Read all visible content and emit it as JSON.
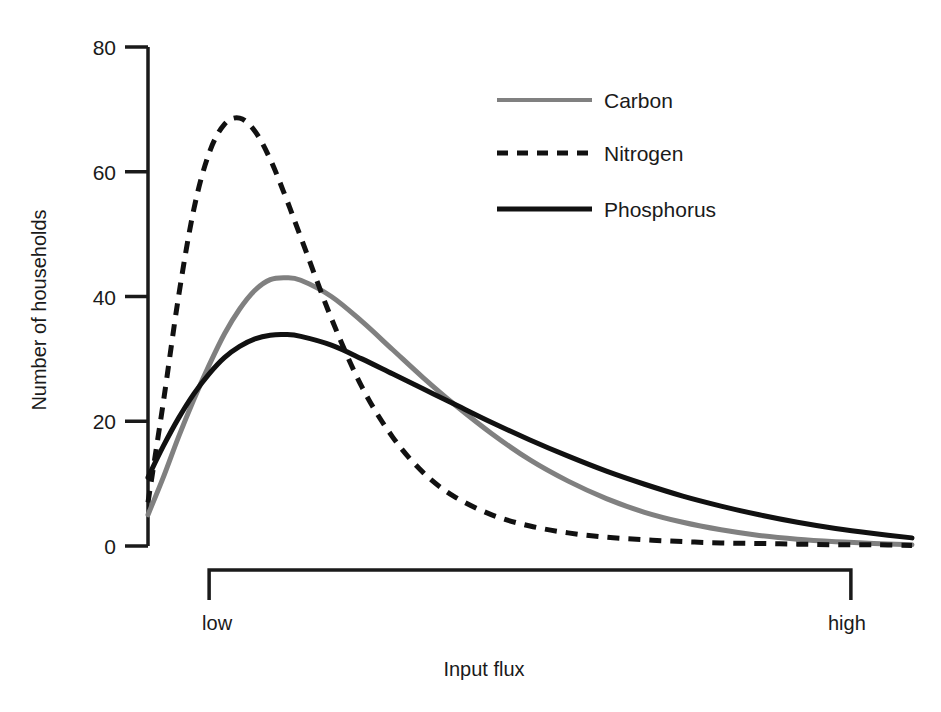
{
  "chart_data": {
    "type": "line",
    "title": "",
    "xlabel": "Input flux",
    "ylabel": "Number of households",
    "grid": false,
    "legend_position": "top-right",
    "ylim": [
      0,
      80
    ],
    "yticks": [
      0,
      20,
      40,
      60,
      80
    ],
    "ytick_labels": [
      "0",
      "20",
      "40",
      "60",
      "80"
    ],
    "xlim": [
      0,
      100
    ],
    "xticks": [
      8,
      92
    ],
    "xtick_labels": [
      "low",
      "high"
    ],
    "x": [
      0,
      2,
      4,
      6,
      8,
      10,
      12,
      14,
      16,
      18,
      20,
      24,
      28,
      32,
      36,
      40,
      45,
      50,
      55,
      60,
      65,
      70,
      75,
      80,
      85,
      90,
      95,
      100
    ],
    "series": [
      {
        "name": "Carbon",
        "color": "#808080",
        "style": "solid",
        "width": 5,
        "values": [
          5.0,
          11.0,
          17.5,
          23.5,
          29.0,
          34.0,
          38.0,
          41.0,
          42.7,
          43.0,
          42.6,
          40.0,
          36.0,
          31.5,
          27.0,
          22.8,
          18.0,
          13.8,
          10.4,
          7.6,
          5.4,
          3.8,
          2.6,
          1.7,
          1.1,
          0.7,
          0.4,
          0.2
        ]
      },
      {
        "name": "Nitrogen",
        "color": "#111111",
        "style": "dashed",
        "width": 5,
        "values": [
          7.0,
          23.0,
          40.0,
          54.0,
          63.0,
          67.6,
          68.6,
          66.5,
          62.0,
          56.0,
          49.5,
          36.5,
          25.5,
          17.5,
          11.8,
          8.0,
          5.0,
          3.2,
          2.1,
          1.4,
          1.0,
          0.7,
          0.5,
          0.4,
          0.3,
          0.2,
          0.2,
          0.1
        ]
      },
      {
        "name": "Phosphorus",
        "color": "#111111",
        "style": "solid",
        "width": 5,
        "values": [
          11.0,
          16.0,
          20.5,
          24.4,
          27.6,
          30.2,
          32.0,
          33.2,
          33.8,
          33.9,
          33.6,
          32.2,
          30.0,
          27.6,
          25.2,
          22.8,
          19.8,
          17.0,
          14.4,
          12.0,
          9.9,
          8.0,
          6.4,
          5.0,
          3.8,
          2.8,
          2.0,
          1.3
        ]
      }
    ]
  },
  "axes": {
    "y_title": "Number of households",
    "x_title": "Input flux",
    "y_tick_labels": [
      "80",
      "60",
      "40",
      "20",
      "0"
    ],
    "x_low_label": "low",
    "x_high_label": "high"
  },
  "legend": {
    "items": [
      {
        "label": "Carbon",
        "swatch": "gray-solid-line"
      },
      {
        "label": "Nitrogen",
        "swatch": "black-dashed-line"
      },
      {
        "label": "Phosphorus",
        "swatch": "black-solid-line"
      }
    ]
  }
}
